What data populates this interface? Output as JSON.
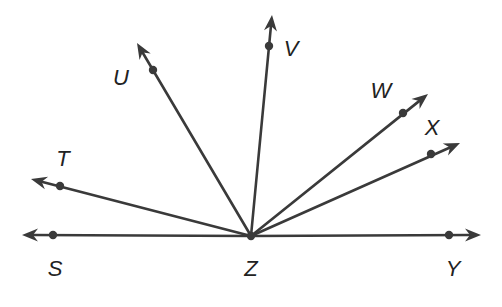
{
  "diagram": {
    "type": "rays_from_common_vertex",
    "color": "#3a3a3a",
    "vertex": {
      "label": "Z",
      "x": 251,
      "y": 236,
      "label_x": 251,
      "label_y": 276
    },
    "rays": [
      {
        "name": "S",
        "label": "S",
        "point": [
          53,
          235
        ],
        "tip": [
          22,
          235
        ],
        "label_pos": [
          55,
          276
        ]
      },
      {
        "name": "T",
        "label": "T",
        "point": [
          60,
          186
        ],
        "tip": [
          31,
          179
        ],
        "label_pos": [
          63,
          166
        ]
      },
      {
        "name": "U",
        "label": "U",
        "point": [
          153,
          70
        ],
        "tip": [
          137,
          43
        ],
        "label_pos": [
          121,
          85
        ]
      },
      {
        "name": "V",
        "label": "V",
        "point": [
          269,
          46
        ],
        "tip": [
          272,
          15
        ],
        "label_pos": [
          291,
          56
        ]
      },
      {
        "name": "W",
        "label": "W",
        "point": [
          403,
          113
        ],
        "tip": [
          428,
          94
        ],
        "label_pos": [
          381,
          98
        ]
      },
      {
        "name": "X",
        "label": "X",
        "point": [
          431,
          154
        ],
        "tip": [
          460,
          143
        ],
        "label_pos": [
          432,
          135
        ]
      },
      {
        "name": "Y",
        "label": "Y",
        "point": [
          449,
          235
        ],
        "tip": [
          481,
          235
        ],
        "label_pos": [
          453,
          276
        ]
      }
    ]
  }
}
